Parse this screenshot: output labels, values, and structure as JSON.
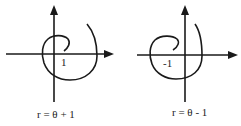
{
  "figures": [
    {
      "name": "spiral-plus",
      "axis_label": "1",
      "caption": "r = θ + 1"
    },
    {
      "name": "spiral-minus",
      "axis_label": "-1",
      "caption": "r = θ - 1"
    }
  ],
  "colors": {
    "stroke": "#1a1a1a",
    "background": "#ffffff"
  }
}
